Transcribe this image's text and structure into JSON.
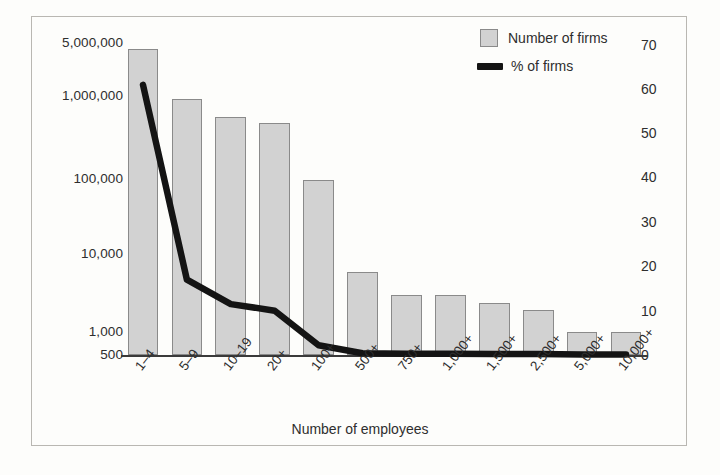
{
  "figure": {
    "border_color": "#b9b7b2",
    "background": "#fdfdfb"
  },
  "legend": {
    "position": "top-right",
    "items": [
      {
        "label": "Number of firms",
        "marker": "bar-swatch-icon",
        "color": "#d2d2d2"
      },
      {
        "label": "% of firms",
        "marker": "line-swatch-icon",
        "color": "#141414"
      }
    ]
  },
  "axes": {
    "x_title": "Number of employees",
    "y_left_labels": [
      "5,000,000",
      "1,000,000",
      "100,000",
      "10,000",
      "1,000",
      "500"
    ],
    "y_right_labels": [
      "70",
      "60",
      "50",
      "40",
      "30",
      "20",
      "10",
      "0"
    ]
  },
  "chart_data": {
    "type": "bar",
    "title": "",
    "subtitle": "",
    "xlabel": "Number of employees",
    "ylabel": "",
    "grid": false,
    "legend_position": "top-right",
    "categories": [
      "1–4",
      "5–9",
      "10–19",
      "20+",
      "100+",
      "500+",
      "750+",
      "1,000+",
      "1,500+",
      "2,500+",
      "5,000+",
      "10,000+"
    ],
    "series": [
      {
        "name": "Number of firms",
        "type": "bar",
        "axis": "left",
        "color": "#d2d2d2",
        "scale": "log",
        "ylim": [
          500,
          10000000
        ],
        "ytick_values": [
          5000000,
          1000000,
          100000,
          10000,
          1000,
          500
        ],
        "ytick_labels": [
          "5,000,000",
          "1,000,000",
          "100,000",
          "10,000",
          "1,000",
          "500"
        ],
        "values": [
          4700000,
          1050000,
          620000,
          520000,
          95000,
          6000,
          3000,
          3000,
          2400,
          1900,
          1000,
          1000
        ]
      },
      {
        "name": "% of firms",
        "type": "line",
        "axis": "right",
        "color": "#141414",
        "scale": "linear",
        "ylim": [
          0,
          70
        ],
        "ytick_values": [
          70,
          60,
          50,
          40,
          30,
          20,
          10,
          0
        ],
        "ytick_labels": [
          "70",
          "60",
          "50",
          "40",
          "30",
          "20",
          "10",
          "0"
        ],
        "values": [
          61,
          17,
          11.5,
          10,
          2.2,
          0.4,
          0.3,
          0.3,
          0.2,
          0.2,
          0.1,
          0.1
        ]
      }
    ]
  }
}
